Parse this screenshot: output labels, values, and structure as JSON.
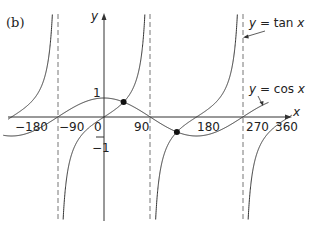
{
  "panel_label": "(b)",
  "axes": {
    "x_label": "x",
    "y_label": "y",
    "x_ticks": [
      "−180",
      "−90",
      "0",
      "90",
      "180",
      "270",
      "360"
    ],
    "y_ticks": [
      "1",
      "−1"
    ]
  },
  "legend": {
    "tan_label": "y = tan x",
    "cos_label": "y = cos x"
  },
  "chart_data": {
    "type": "line",
    "title": "(b)",
    "xlabel": "x",
    "ylabel": "y",
    "xlim": [
      -200,
      370
    ],
    "ylim": [
      -5.5,
      5.5
    ],
    "x_tick_labels": [
      "-180",
      "-90",
      "0",
      "90",
      "180",
      "270",
      "360"
    ],
    "y_tick_labels": [
      "1",
      "-1"
    ],
    "grid": false,
    "series": [
      {
        "name": "y = tan x",
        "function": "tan(x)",
        "x_range_deg": [
          -200,
          370
        ],
        "asymptotes": [
          -90,
          90,
          270
        ]
      },
      {
        "name": "y = cos x",
        "function": "cos(x)",
        "x_range_deg": [
          -200,
          320
        ]
      }
    ],
    "intersections": [
      {
        "x": 38.2,
        "y": 0.786
      },
      {
        "x": 141.8,
        "y": -0.786
      }
    ],
    "annotations": [
      "y = tan x",
      "y = cos x"
    ]
  }
}
